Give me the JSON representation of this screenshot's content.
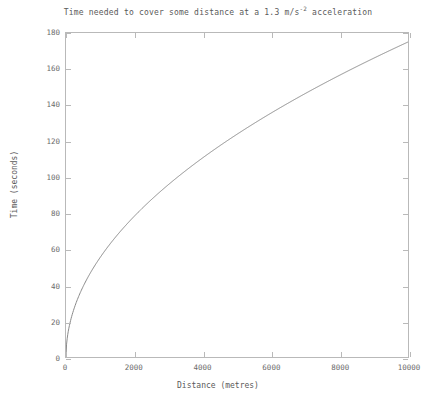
{
  "chart_data": {
    "type": "line",
    "title": "Time needed to cover some distance at a 1.3 m/s",
    "title_exponent": "-2",
    "title_suffix": " acceleration",
    "xlabel": "Distance (metres)",
    "ylabel": "Time (seconds)",
    "xlim": [
      0,
      10000
    ],
    "ylim": [
      0,
      180
    ],
    "grid": false,
    "legend": false,
    "line_color": "#8a8a8a",
    "axis_color": "#b9b9b9",
    "text_color": "#5a5a5a",
    "acceleration": 1.3,
    "formula": "t = sqrt(2d/a)",
    "xticks": [
      0,
      2000,
      4000,
      6000,
      8000,
      10000
    ],
    "xtick_labels": [
      "0",
      "2000",
      "4000",
      "6000",
      "8000",
      "10000"
    ],
    "yticks": [
      0,
      20,
      40,
      60,
      80,
      100,
      120,
      140,
      160,
      180
    ],
    "ytick_labels": [
      "0",
      "20",
      "40",
      "60",
      "80",
      "100",
      "120",
      "140",
      "160",
      "180"
    ],
    "series": [
      {
        "name": "time",
        "x": [
          0,
          50,
          100,
          200,
          300,
          400,
          500,
          600,
          800,
          1000,
          1200,
          1500,
          1800,
          2000,
          2400,
          2800,
          3200,
          3600,
          4000,
          4400,
          4800,
          5200,
          5600,
          6000,
          6400,
          6800,
          7200,
          7600,
          8000,
          8400,
          8800,
          9200,
          9600,
          10000
        ],
        "y": [
          0,
          8.8,
          12.4,
          17.5,
          21.5,
          24.8,
          27.7,
          30.4,
          35.1,
          39.2,
          43.0,
          48.0,
          52.6,
          55.5,
          60.8,
          65.6,
          70.2,
          74.4,
          78.4,
          82.3,
          85.9,
          89.4,
          92.8,
          96.1,
          99.2,
          102.3,
          105.3,
          108.1,
          110.9,
          113.7,
          116.3,
          118.9,
          121.5,
          124.0
        ]
      }
    ],
    "endpoint": {
      "x": 10000,
      "y": 175
    },
    "curve_note": "monotonic square-root curve, steep near origin, flattening toward the right"
  }
}
